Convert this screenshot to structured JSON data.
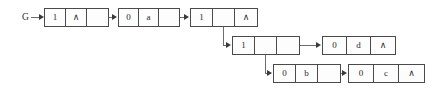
{
  "diagram": {
    "title": "G",
    "root_label": "G",
    "null_symbol": "∧",
    "rows": [
      {
        "name": "row-top",
        "nodes": [
          {
            "id": "node-head",
            "x": 44,
            "y": 8,
            "cell_width": 21,
            "cells": [
              {
                "name": "tag-cell",
                "value": "1"
              },
              {
                "name": "data-cell",
                "value": "∧"
              },
              {
                "name": "link-cell",
                "value": ""
              }
            ]
          },
          {
            "id": "node-a",
            "x": 118,
            "y": 8,
            "cell_width": 20,
            "cells": [
              {
                "name": "tag-cell",
                "value": "0"
              },
              {
                "name": "data-cell",
                "value": "a"
              },
              {
                "name": "link-cell",
                "value": ""
              }
            ]
          },
          {
            "id": "node-sublist-1",
            "x": 190,
            "y": 8,
            "cell_width": 22,
            "cells": [
              {
                "name": "tag-cell",
                "value": "1"
              },
              {
                "name": "data-cell",
                "value": ""
              },
              {
                "name": "link-cell",
                "value": "∧"
              }
            ]
          }
        ]
      },
      {
        "name": "row-middle",
        "nodes": [
          {
            "id": "node-sublist-2",
            "x": 232,
            "y": 36,
            "cell_width": 22,
            "cells": [
              {
                "name": "tag-cell",
                "value": "1"
              },
              {
                "name": "data-cell",
                "value": ""
              },
              {
                "name": "link-cell",
                "value": ""
              }
            ]
          },
          {
            "id": "node-d",
            "x": 322,
            "y": 36,
            "cell_width": 24,
            "cells": [
              {
                "name": "tag-cell",
                "value": "0"
              },
              {
                "name": "data-cell",
                "value": "d"
              },
              {
                "name": "link-cell",
                "value": "∧"
              }
            ]
          }
        ]
      },
      {
        "name": "row-bottom",
        "nodes": [
          {
            "id": "node-b",
            "x": 273,
            "y": 64,
            "cell_width": 22,
            "cells": [
              {
                "name": "tag-cell",
                "value": "0"
              },
              {
                "name": "data-cell",
                "value": "b"
              },
              {
                "name": "link-cell",
                "value": ""
              }
            ]
          },
          {
            "id": "node-c",
            "x": 348,
            "y": 64,
            "cell_width": 25,
            "cells": [
              {
                "name": "tag-cell",
                "value": "0"
              },
              {
                "name": "data-cell",
                "value": "c"
              },
              {
                "name": "link-cell",
                "value": "∧"
              }
            ]
          }
        ]
      }
    ],
    "colors": {
      "box_border": "#4a4a4a",
      "connector": "#6d6d6d",
      "arrow": "#3a3a3a",
      "text": "#2b2b2b",
      "background": "#ffffff"
    }
  }
}
